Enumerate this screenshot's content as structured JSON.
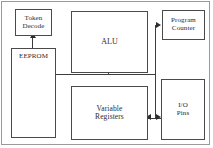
{
  "diagram": {
    "frame_color": "#9a9a9a",
    "box_border_color": "#4a4a4a",
    "wire_color": "#3d3d3d",
    "background": "#ffffff",
    "blocks": [
      {
        "id": "token-decode",
        "label": "Token\nDecode"
      },
      {
        "id": "eeprom",
        "label": "EEPROM"
      },
      {
        "id": "alu",
        "label": "ALU"
      },
      {
        "id": "program-counter",
        "label": "Program\nCounter"
      },
      {
        "id": "variable-registers",
        "label": "Variable\nRegisters"
      },
      {
        "id": "io-pins",
        "label": "I/O\nPins"
      }
    ],
    "connectors": [
      {
        "id": "eeprom-to-token-decode",
        "from": "eeprom",
        "to": "token-decode",
        "direction": "up",
        "arrowheads": 1
      },
      {
        "id": "bus-to-alu",
        "from": "eeprom",
        "to": "alu",
        "direction": "up",
        "arrowheads": 1
      },
      {
        "id": "bus-to-program-counter",
        "from": "eeprom",
        "to": "program-counter",
        "direction": "right",
        "arrowheads": 1
      },
      {
        "id": "registers-to-io-pins",
        "from": "variable-registers",
        "to": "io-pins",
        "direction": "bidirectional",
        "arrowheads": 2
      }
    ]
  },
  "labels": {
    "token_decode_line1": "Token",
    "token_decode_line2": "Decode",
    "eeprom": "EEPROM",
    "alu": "ALU",
    "program_counter_line1": "Program",
    "program_counter_line2": "Counter",
    "variable_registers_line1": "Variable",
    "variable_registers_line2": "Registers",
    "io_pins_line1": "I/O",
    "io_pins_line2": "Pins"
  }
}
